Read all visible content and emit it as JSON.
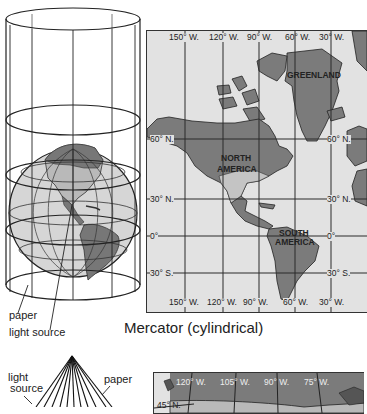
{
  "figure_1": {
    "left_diagram": {
      "labels": {
        "paper": "paper",
        "light_source": "light source"
      }
    },
    "map": {
      "top_ticks": [
        "150° W.",
        "120° W.",
        "90° W.",
        "60° W.",
        "30° W."
      ],
      "bottom_ticks": [
        "150° W.",
        "120° W.",
        "90° W.",
        "60° W.",
        "30° W."
      ],
      "left_ticks": [
        "60° N.",
        "30° N.",
        "0°",
        "30° S."
      ],
      "right_ticks": [
        "60° N.",
        "30° N.",
        "0°",
        "30° S."
      ],
      "regions": {
        "greenland": "GREENLAND",
        "north_america_1": "NORTH",
        "north_america_2": "AMERICA",
        "south_america_1": "SOUTH",
        "south_america_2": "AMERICA"
      }
    },
    "caption": "Mercator (cylindrical)"
  },
  "figure_2": {
    "left_diagram": {
      "labels": {
        "light_source_1": "light",
        "light_source_2": "source",
        "paper": "paper"
      }
    },
    "map": {
      "top_ticks": [
        "120° W.",
        "105° W.",
        "90° W.",
        "75° W."
      ],
      "left_ticks": [
        "45° N."
      ]
    }
  },
  "colors": {
    "land": "#7b7b7b",
    "ocean": "#e2e2e2",
    "grid": "#2a2a2a",
    "globe_ocean": "#d6d6d6",
    "globe_land_light": "#b9b9b9",
    "globe_land_dark": "#777777"
  }
}
